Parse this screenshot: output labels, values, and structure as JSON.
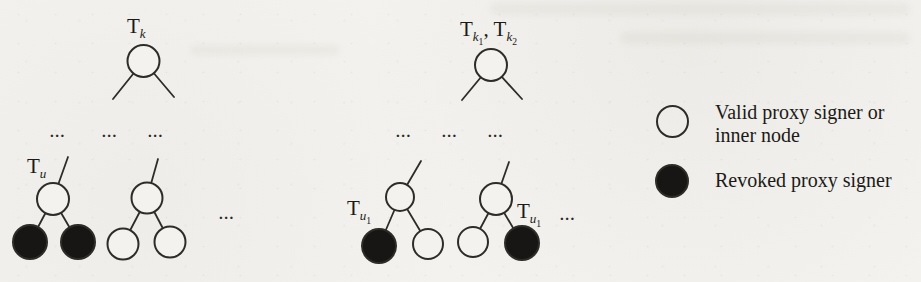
{
  "colors": {
    "background": "#f3f2ee",
    "stroke": "#2e2c29",
    "node_valid_fill": "#f3f2ee",
    "node_revoked_fill": "#181614",
    "text": "#1c1a18"
  },
  "diagram": {
    "ellipsis": "...",
    "upper_left_tree": {
      "root_type": "valid",
      "label": {
        "base": "T",
        "sub": "k"
      }
    },
    "upper_right_tree": {
      "root_type": "valid",
      "label": {
        "base1": "T",
        "sub1": "k",
        "subsub1": "1",
        "separator": ", ",
        "base2": "T",
        "sub2": "k",
        "subsub2": "2"
      }
    },
    "lower_left_tree_1": {
      "root_type": "valid",
      "left_child_type": "revoked",
      "right_child_type": "revoked",
      "label": {
        "base": "T",
        "sub": "u"
      }
    },
    "lower_left_tree_2": {
      "root_type": "valid",
      "left_child_type": "valid",
      "right_child_type": "valid"
    },
    "lower_right_tree_1": {
      "root_type": "valid",
      "left_child_type": "revoked",
      "right_child_type": "valid",
      "label": {
        "base": "T",
        "sub": "u",
        "subsub": "1"
      }
    },
    "lower_right_tree_2": {
      "root_type": "valid",
      "left_child_type": "valid",
      "right_child_type": "revoked",
      "label": {
        "base": "T",
        "sub": "u",
        "subsub": "1"
      }
    }
  },
  "legend": {
    "valid_label": "Valid proxy signer or inner node",
    "revoked_label": "Revoked proxy signer"
  }
}
